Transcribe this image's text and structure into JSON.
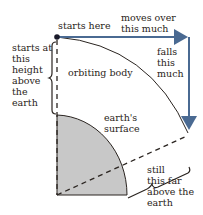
{
  "diagram": {
    "labels": {
      "start": "starts here",
      "moves": "moves over\nthis much",
      "falls": "falls\nthis\nmuch",
      "height": "starts at\nthis\nheight\nabove\nthe\nearth",
      "body": "orbiting body",
      "surface": "earth's\nsurface",
      "still": "still\nthis far\nabove the\nearth"
    },
    "colors": {
      "arrow": "#4a6a92",
      "earth_fill": "#c8c8c8",
      "line": "#2a2420",
      "text": "#2a2420"
    }
  }
}
